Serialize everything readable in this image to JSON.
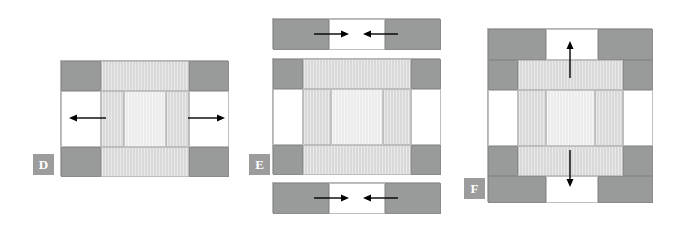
{
  "figure": {
    "type": "diagram",
    "background_color": "#ffffff",
    "palette": {
      "dark_gray": "#999a9a",
      "light_gray": "#d9d9d9",
      "pale_gray": "#ececec",
      "white": "#ffffff",
      "outline": "#b5b5b5",
      "badge_fill": "#9c9c9c",
      "badge_text": "#ffffff",
      "arrow": "#000000"
    }
  },
  "panels": [
    {
      "id": "D",
      "label": "D",
      "badge": {
        "x": 33,
        "y": 154,
        "w": 21,
        "h": 21
      },
      "frame": {
        "x": 60,
        "y": 60,
        "w": 168,
        "h": 116
      },
      "arrows": [
        {
          "name": "arrow-left",
          "direction": "left",
          "x": 70,
          "y": 118,
          "length": 36
        },
        {
          "name": "arrow-right",
          "direction": "right",
          "x": 188,
          "y": 118,
          "length": 36
        }
      ],
      "arrow_count": 2,
      "motion": "horizontal outward (expansion)"
    },
    {
      "id": "E",
      "label": "E",
      "badge": {
        "x": 249,
        "y": 154,
        "w": 21,
        "h": 21
      },
      "frame": {
        "x": 272,
        "y": 58,
        "w": 168,
        "h": 116
      },
      "strips": [
        {
          "name": "top-strip",
          "x": 272,
          "y": 18,
          "w": 168,
          "h": 31
        },
        {
          "name": "bottom-strip",
          "x": 272,
          "y": 182,
          "w": 168,
          "h": 31
        }
      ],
      "arrows": [
        {
          "name": "strip-arrow-right-top",
          "direction": "right",
          "x": 316,
          "y": 33,
          "length": 34
        },
        {
          "name": "strip-arrow-left-top",
          "direction": "left",
          "x": 362,
          "y": 33,
          "length": 34
        },
        {
          "name": "strip-arrow-right-bottom",
          "direction": "right",
          "x": 316,
          "y": 197,
          "length": 34
        },
        {
          "name": "strip-arrow-left-bottom",
          "direction": "left",
          "x": 362,
          "y": 197,
          "length": 34
        }
      ],
      "arrow_count": 4,
      "motion": "horizontal inward (compression) on detached top and bottom strips"
    },
    {
      "id": "F",
      "label": "F",
      "badge": {
        "x": 464,
        "y": 178,
        "w": 21,
        "h": 21
      },
      "frame": {
        "x": 487,
        "y": 28,
        "w": 165,
        "h": 174
      },
      "arrows": [
        {
          "name": "arrow-up",
          "direction": "up",
          "x": 569,
          "y": 42,
          "length": 36
        },
        {
          "name": "arrow-down",
          "direction": "down",
          "x": 569,
          "y": 152,
          "length": 36
        }
      ],
      "arrow_count": 2,
      "motion": "vertical outward (expansion)"
    }
  ]
}
